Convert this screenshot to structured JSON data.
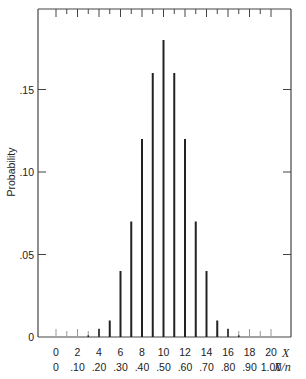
{
  "chart_data": {
    "type": "bar",
    "title": "",
    "ylabel": "Probability",
    "xlabel": "X",
    "secondary_xlabel": "X/n",
    "n": 20,
    "x": [
      0,
      1,
      2,
      3,
      4,
      5,
      6,
      7,
      8,
      9,
      10,
      11,
      12,
      13,
      14,
      15,
      16,
      17,
      18,
      19,
      20
    ],
    "values": [
      0,
      0,
      0,
      0.001,
      0.005,
      0.01,
      0.04,
      0.07,
      0.12,
      0.16,
      0.18,
      0.16,
      0.12,
      0.07,
      0.04,
      0.01,
      0.005,
      0.001,
      0,
      0,
      0
    ],
    "ylim": [
      0,
      0.2
    ],
    "xlim": [
      -1.7,
      22
    ],
    "y_ticks": [
      0,
      0.05,
      0.1,
      0.15
    ],
    "y_tick_labels": [
      "0",
      ".05",
      ".10",
      ".15"
    ],
    "x_tick_values": [
      0,
      2,
      4,
      6,
      8,
      10,
      12,
      14,
      16,
      18,
      20
    ],
    "x_tick_labels": [
      "0",
      "2",
      "4",
      "6",
      "8",
      "10",
      "12",
      "14",
      "16",
      "18",
      "20"
    ],
    "secondary_x_tick_labels": [
      "0",
      ".10",
      ".20",
      ".30",
      ".40",
      ".50",
      ".60",
      ".70",
      ".80",
      ".90",
      "1.00"
    ],
    "grid": false,
    "legend": null
  },
  "colors": {
    "bar": "#222222",
    "axis": "#444444",
    "zero_tick": "#999999"
  }
}
